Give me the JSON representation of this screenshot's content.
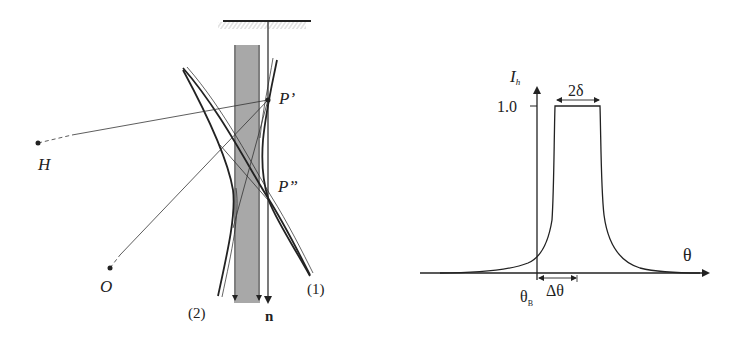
{
  "left_diagram": {
    "points": {
      "P_prime": "P’",
      "P_double_prime": "P”",
      "H": "H",
      "O": "O"
    },
    "curves": {
      "curve1": "(1)",
      "curve2": "(2)"
    },
    "normal_vector": "n"
  },
  "right_plot": {
    "y_axis_label": "I",
    "y_axis_subscript": "h",
    "y_tick": "1.0",
    "x_axis_label": "θ",
    "width_label": "2δ",
    "bragg_label": "θ",
    "bragg_subscript": "B",
    "offset_label": "Δθ"
  },
  "colors": {
    "ink": "#222222",
    "slab": "#a8a8a8",
    "hatch": "#c8c8c8"
  }
}
